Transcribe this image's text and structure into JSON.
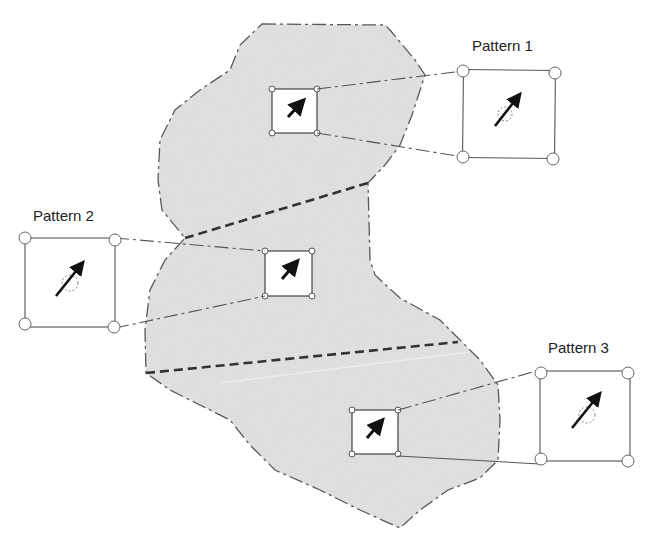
{
  "diagram": {
    "region": {
      "fill": "#e4e4e4",
      "outline_color": "#555555",
      "outline_style": "dashed"
    },
    "partitions": [
      {
        "name": "boundary-1-2",
        "style": "bold-dashed"
      },
      {
        "name": "boundary-2-3",
        "style": "bold-dashed"
      }
    ],
    "patterns": [
      {
        "id": 1,
        "label": "Pattern 1",
        "icon": "arrow-icon"
      },
      {
        "id": 2,
        "label": "Pattern 2",
        "icon": "arrow-icon"
      },
      {
        "id": 3,
        "label": "Pattern 3",
        "icon": "arrow-icon"
      }
    ]
  }
}
